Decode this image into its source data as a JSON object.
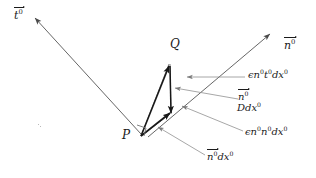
{
  "figure": {
    "background_color": "#ffffff",
    "stroke_color": "#2b2b2b",
    "thin_stroke_color": "#6b6b6b",
    "text_color": "#1a1a1a",
    "width": 316,
    "height": 178
  },
  "labels": {
    "t_vector": {
      "base": "t",
      "superscript": "0"
    },
    "n_vector": {
      "base": "n",
      "superscript": "0"
    },
    "point_Q": "Q",
    "point_P": "P",
    "epsilon_n_t_dx": {
      "epsilon": "ϵ",
      "n": "n",
      "n_sup": "0",
      "t": "t",
      "t_sup": "0",
      "dx": "dx",
      "dx_sup": "0"
    },
    "n_D_dx": {
      "n": "n",
      "n_sup": "0",
      "D": "D",
      "dx": "dx",
      "dx_sup": "0"
    },
    "epsilon_n_n_dx": {
      "epsilon": "ϵ",
      "n1": "n",
      "n1_sup": "0",
      "n2": "n",
      "n2_sup": "0",
      "dx": "dx",
      "dx_sup": "0"
    },
    "n_dx": {
      "n": "n",
      "n_sup": "0",
      "dx": "dx",
      "dx_sup": "0"
    }
  },
  "geometry": {
    "point_P": {
      "x": 140,
      "y": 137
    },
    "point_Q": {
      "x": 170,
      "y": 63
    },
    "point_R": {
      "x": 171,
      "y": 115
    },
    "t_arrow_tip": {
      "x": 33,
      "y": 17
    },
    "n_arrow_tip": {
      "x": 271,
      "y": 33
    },
    "right_angle_at": "P"
  }
}
